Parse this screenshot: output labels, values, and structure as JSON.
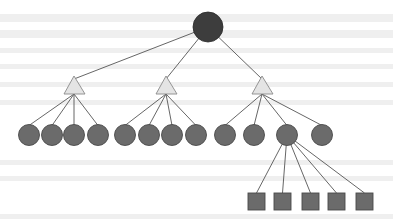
{
  "diagram": {
    "type": "tree",
    "colors": {
      "root_fill": "#3d3d3d",
      "triangle_fill": "#e4e4e4",
      "triangle_stroke": "#8a8a8a",
      "circle_fill": "#6b6b6b",
      "circle_stroke": "#4a4a4a",
      "square_fill": "#6b6b6b",
      "square_stroke": "#4a4a4a",
      "edge": "#555555",
      "background": "#ffffff",
      "bleed_through": "#efefef"
    },
    "root": {
      "shape": "circle",
      "cx": 208,
      "cy": 27,
      "r": 15
    },
    "triangles": [
      {
        "id": "t1",
        "apex": [
          74,
          76
        ],
        "base_left": [
          64,
          94
        ],
        "base_right": [
          85,
          94
        ]
      },
      {
        "id": "t2",
        "apex": [
          166,
          76
        ],
        "base_left": [
          156,
          94
        ],
        "base_right": [
          177,
          94
        ]
      },
      {
        "id": "t3",
        "apex": [
          262,
          76
        ],
        "base_left": [
          252,
          94
        ],
        "base_right": [
          273,
          94
        ]
      }
    ],
    "leaf_groups": [
      {
        "parent": "t1",
        "circles": [
          {
            "cx": 29,
            "cy": 135
          },
          {
            "cx": 52,
            "cy": 135
          },
          {
            "cx": 74,
            "cy": 135
          },
          {
            "cx": 98,
            "cy": 135
          }
        ]
      },
      {
        "parent": "t2",
        "circles": [
          {
            "cx": 125,
            "cy": 135
          },
          {
            "cx": 149,
            "cy": 135
          },
          {
            "cx": 172,
            "cy": 135
          },
          {
            "cx": 196,
            "cy": 135
          }
        ]
      },
      {
        "parent": "t3",
        "circles": [
          {
            "cx": 225,
            "cy": 135
          },
          {
            "cx": 254,
            "cy": 135
          },
          {
            "cx": 287,
            "cy": 135
          },
          {
            "cx": 322,
            "cy": 135
          }
        ]
      }
    ],
    "leaf_radius": 10.5,
    "expanded_node": {
      "cx": 287,
      "cy": 135
    },
    "squares": [
      {
        "x": 248,
        "y": 193,
        "size": 17
      },
      {
        "x": 274,
        "y": 193,
        "size": 17
      },
      {
        "x": 302,
        "y": 193,
        "size": 17
      },
      {
        "x": 328,
        "y": 193,
        "size": 17
      },
      {
        "x": 356,
        "y": 193,
        "size": 17
      }
    ],
    "bleed_bands": [
      {
        "y": 14,
        "h": 8
      },
      {
        "y": 30,
        "h": 8
      },
      {
        "y": 48,
        "h": 5
      },
      {
        "y": 64,
        "h": 5
      },
      {
        "y": 82,
        "h": 5
      },
      {
        "y": 100,
        "h": 5
      },
      {
        "y": 160,
        "h": 5
      },
      {
        "y": 176,
        "h": 5
      },
      {
        "y": 214,
        "h": 5
      }
    ]
  }
}
